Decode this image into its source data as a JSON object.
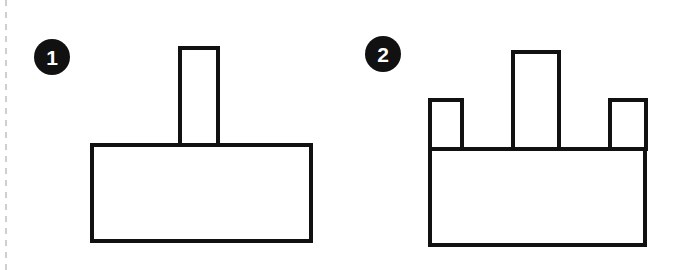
{
  "page": {
    "background_color": "#ffffff",
    "stroke_color": "#111111",
    "fill_color": "#ffffff",
    "badge_color": "#111111",
    "badge_text_color": "#ffffff",
    "divider_color": "#cfcfcf",
    "width": 674,
    "height": 270
  },
  "divider": {
    "name": "left-dashed-divider",
    "orientation": "vertical",
    "x": 6,
    "y1": 0,
    "y2": 270,
    "dash": "6 6",
    "stroke_width": 2
  },
  "figures": [
    {
      "step_number": "1",
      "badge": {
        "cx": 52,
        "cy": 57,
        "r": 18
      },
      "base": {
        "name": "base-block",
        "x": 92,
        "y": 145,
        "width": 219,
        "height": 96
      },
      "tabs": [
        {
          "name": "center-tab",
          "x": 180,
          "y": 48,
          "width": 38,
          "height": 97
        }
      ],
      "tab_count": 1,
      "base_top_line_over_tabs": false
    },
    {
      "step_number": "2",
      "badge": {
        "cx": 383,
        "cy": 54,
        "r": 18
      },
      "base": {
        "name": "base-block",
        "x": 430,
        "y": 149,
        "width": 215,
        "height": 96
      },
      "tabs": [
        {
          "name": "left-tab",
          "x": 430,
          "y": 100,
          "width": 32,
          "height": 49
        },
        {
          "name": "center-tab",
          "x": 513,
          "y": 52,
          "width": 46,
          "height": 97
        },
        {
          "name": "right-tab",
          "x": 610,
          "y": 100,
          "width": 36,
          "height": 49
        }
      ],
      "tab_count": 3,
      "base_top_line_over_tabs": true
    }
  ],
  "geometry": {
    "stroke_width": 4
  }
}
